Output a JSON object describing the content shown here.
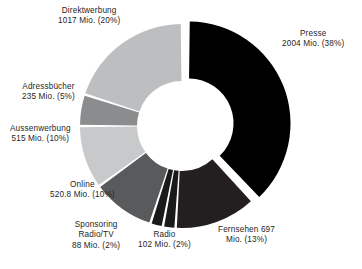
{
  "chart_data": {
    "type": "pie",
    "variant": "donut",
    "title": "",
    "subtitle": "",
    "xlabel": "",
    "ylabel": "",
    "units": "Mio.",
    "legend_position": "none",
    "grid": false,
    "labels_outside": true,
    "total_value": 5178.8,
    "start_angle_deg": 0,
    "direction": "clockwise",
    "categories": [
      "Presse",
      "Fernsehen",
      "Radio",
      "Sponsoring Radio/TV",
      "Online",
      "Aussenwerbung",
      "Adressbücher",
      "Direktwerbung"
    ],
    "values": [
      2004,
      697,
      102,
      88,
      520.8,
      515,
      235,
      1017
    ],
    "percentages": [
      38,
      13,
      2,
      2,
      10,
      10,
      5,
      20
    ],
    "colors": [
      "#000000",
      "#231f20",
      "#1a1a1a",
      "#1a1a1a",
      "#595a5c",
      "#c8c9ca",
      "#8a8c8e",
      "#bcbec0"
    ],
    "exploded": [
      true,
      false,
      false,
      false,
      false,
      false,
      false,
      false
    ],
    "slices": [
      {
        "name": "Presse",
        "value": 2004,
        "value_text": "2004 Mio.",
        "percent": 38,
        "percent_text": "(38%)",
        "color": "#000000",
        "label_line1": "Presse",
        "label_line2": "2004 Mio. (38%)"
      },
      {
        "name": "Fernsehen",
        "value": 697,
        "value_text": "697 Mio.",
        "percent": 13,
        "percent_text": "(13%)",
        "color": "#231f20",
        "label_line1": "Fernsehen 697",
        "label_line2": "Mio. (13%)"
      },
      {
        "name": "Radio",
        "value": 102,
        "value_text": "102 Mio.",
        "percent": 2,
        "percent_text": "(2%)",
        "color": "#1a1a1a",
        "label_line1": "Radio",
        "label_line2": "102 Mio. (2%)"
      },
      {
        "name": "Sponsoring Radio/TV",
        "value": 88,
        "value_text": "88 Mio.",
        "percent": 2,
        "percent_text": "(2%)",
        "color": "#1a1a1a",
        "label_line1": "Sponsoring",
        "label_line2": "Radio/TV",
        "label_line3": "88 Mio. (2%)"
      },
      {
        "name": "Online",
        "value": 520.8,
        "value_text": "520.8 Mio.",
        "percent": 10,
        "percent_text": "(10%)",
        "color": "#595a5c",
        "label_line1": "Online",
        "label_line2": "520.8 Mio. (10%)"
      },
      {
        "name": "Aussenwerbung",
        "value": 515,
        "value_text": "515 Mio.",
        "percent": 10,
        "percent_text": "(10%)",
        "color": "#c8c9ca",
        "label_line1": "Aussenwerbung",
        "label_line2": "515 Mio. (10%)"
      },
      {
        "name": "Adressbücher",
        "value": 235,
        "value_text": "235 Mio.",
        "percent": 5,
        "percent_text": "(5%)",
        "color": "#8a8c8e",
        "label_line1": "Adressbücher",
        "label_line2": "235 Mio. (5%)"
      },
      {
        "name": "Direktwerbung",
        "value": 1017,
        "value_text": "1017 Mio.",
        "percent": 20,
        "percent_text": "(20%)",
        "color": "#bcbec0",
        "label_line1": "Direktwerbung",
        "label_line2": "1017 Mio. (20%)"
      }
    ]
  },
  "labels": {
    "direktwerbung": {
      "line1": "Direktwerbung",
      "line2": "1017 Mio. (20%)"
    },
    "presse": {
      "line1": "Presse",
      "line2": "2004 Mio. (38%)"
    },
    "adressbuecher": {
      "line1": "Adressbücher",
      "line2": "235 Mio. (5%)"
    },
    "aussenwerbung": {
      "line1": "Aussenwerbung",
      "line2": "515 Mio. (10%)"
    },
    "online": {
      "line1": "Online",
      "line2": "520.8 Mio. (10%)"
    },
    "sponsoring": {
      "line1": "Sponsoring",
      "line2": "Radio/TV",
      "line3": "88 Mio. (2%)"
    },
    "radio": {
      "line1": "Radio",
      "line2": "102 Mio. (2%)"
    },
    "fernsehen": {
      "line1": "Fernsehen 697",
      "line2": "Mio. (13%)"
    }
  },
  "figure": {
    "background_color": "#ffffff",
    "text_color": "#262626"
  }
}
